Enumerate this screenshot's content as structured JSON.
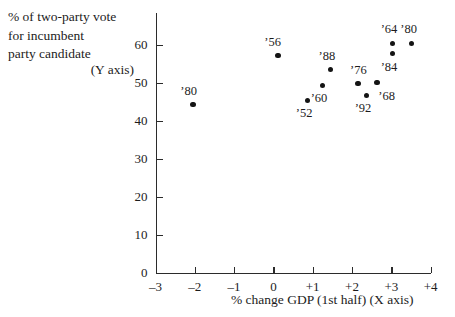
{
  "chart_data": {
    "type": "scatter",
    "title": "",
    "ylabel": "% of two-party vote\nfor incumbent\nparty candidate",
    "ylabel_axis_note": "(Y axis)",
    "xlabel": "% change GDP (1st half)  (X axis)",
    "xlim": [
      -3,
      4
    ],
    "ylim": [
      0,
      60
    ],
    "xticks": [
      "–3",
      "–2",
      "–1",
      "0",
      "+1",
      "+2",
      "+3",
      "+4"
    ],
    "xtick_values": [
      -3,
      -2,
      -1,
      0,
      1,
      2,
      3,
      4
    ],
    "yticks": [
      "0",
      "10",
      "20",
      "30",
      "40",
      "50",
      "60"
    ],
    "ytick_values": [
      0,
      10,
      20,
      30,
      40,
      50,
      60
    ],
    "grid": false,
    "legend": false,
    "points": [
      {
        "label": "’80",
        "x": -2.05,
        "y": 44.2,
        "lx": -2.32,
        "ly": 47.6
      },
      {
        "label": "’56",
        "x": 0.11,
        "y": 57.1,
        "lx": -0.18,
        "ly": 60.5
      },
      {
        "label": "’52",
        "x": 0.87,
        "y": 45.3,
        "lx": 0.62,
        "ly": 41.6
      },
      {
        "label": "’60",
        "x": 1.25,
        "y": 49.2,
        "lx": 1.0,
        "ly": 45.6
      },
      {
        "label": "’88",
        "x": 1.45,
        "y": 53.4,
        "lx": 1.2,
        "ly": 56.8
      },
      {
        "label": "’76",
        "x": 2.16,
        "y": 49.7,
        "lx": 2.0,
        "ly": 53.1
      },
      {
        "label": "’92",
        "x": 2.37,
        "y": 46.6,
        "lx": 2.12,
        "ly": 42.9
      },
      {
        "label": "’68",
        "x": 2.64,
        "y": 50.0,
        "lx": 2.72,
        "ly": 46.3
      },
      {
        "label": "’64",
        "x": 3.03,
        "y": 60.3,
        "lx": 2.78,
        "ly": 63.7
      },
      {
        "label": "’84",
        "x": 3.03,
        "y": 57.6,
        "lx": 2.78,
        "ly": 53.9
      },
      {
        "label": "’80",
        "x": 3.51,
        "y": 60.3,
        "lx": 3.28,
        "ly": 63.7
      }
    ]
  },
  "colors": {
    "point": "#141414",
    "axis": "#2b2b2b",
    "text": "#1c1c1c",
    "background": "#ffffff"
  }
}
